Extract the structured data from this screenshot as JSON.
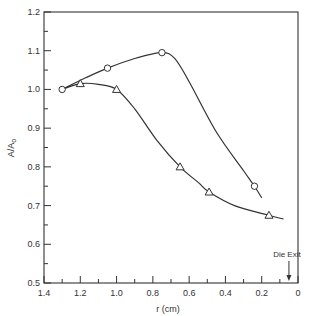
{
  "chart_data": {
    "type": "line",
    "title": "",
    "xlabel": "r (cm)",
    "ylabel": "A/A",
    "ylabel_subscript": "o",
    "xlim": [
      1.4,
      0
    ],
    "ylim": [
      0.5,
      1.2
    ],
    "x_reversed": true,
    "grid": false,
    "legend": "none",
    "x_ticks": [
      1.4,
      1.2,
      1.0,
      0.8,
      0.6,
      0.4,
      0.2,
      0
    ],
    "x_tick_labels": [
      "1.4",
      "1.2",
      "1.0",
      "0.8",
      "0.6",
      "0.4",
      "0.2",
      "0"
    ],
    "y_ticks": [
      0.5,
      0.6,
      0.7,
      0.8,
      0.9,
      1.0,
      1.1,
      1.2
    ],
    "y_tick_labels": [
      "0.5",
      "0.6",
      "0.7",
      "0.8",
      "0.9",
      "1.0",
      "1.1",
      "1.2"
    ],
    "series": [
      {
        "name": "circles",
        "marker": "circle",
        "x": [
          1.3,
          1.05,
          0.75,
          0.24
        ],
        "y": [
          1.0,
          1.055,
          1.095,
          0.75
        ],
        "curve": [
          [
            1.3,
            1.0
          ],
          [
            1.17,
            1.03
          ],
          [
            1.05,
            1.055
          ],
          [
            0.9,
            1.08
          ],
          [
            0.75,
            1.095
          ],
          [
            0.68,
            1.08
          ],
          [
            0.6,
            1.02
          ],
          [
            0.45,
            0.89
          ],
          [
            0.3,
            0.79
          ],
          [
            0.24,
            0.75
          ],
          [
            0.2,
            0.72
          ]
        ]
      },
      {
        "name": "triangles",
        "marker": "triangle",
        "x": [
          1.2,
          1.0,
          0.65,
          0.49,
          0.16
        ],
        "y": [
          1.015,
          1.0,
          0.8,
          0.735,
          0.675
        ],
        "curve": [
          [
            1.3,
            1.0
          ],
          [
            1.2,
            1.015
          ],
          [
            1.1,
            1.013
          ],
          [
            1.0,
            1.0
          ],
          [
            0.9,
            0.95
          ],
          [
            0.78,
            0.87
          ],
          [
            0.65,
            0.8
          ],
          [
            0.55,
            0.76
          ],
          [
            0.49,
            0.735
          ],
          [
            0.35,
            0.7
          ],
          [
            0.16,
            0.675
          ],
          [
            0.08,
            0.665
          ]
        ]
      }
    ],
    "annotations": [
      {
        "text": "Die Exit",
        "x": 0.05,
        "arrow": "down"
      }
    ]
  }
}
